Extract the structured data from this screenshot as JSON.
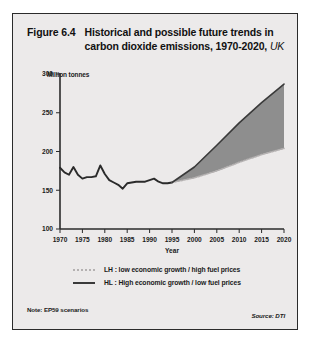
{
  "figure": {
    "number": "Figure 6.4",
    "title_line1": "Historical and possible future trends in",
    "title_line2": "carbon dioxide emissions, 1970-2020,",
    "region": "UK",
    "note": "Note: EP59 scenarios",
    "source": "Source: DTI"
  },
  "legend": {
    "items": [
      {
        "key": "LH",
        "label": "LH : low economic growth / high fuel prices",
        "style": "dotted",
        "color": "#b4b1b1"
      },
      {
        "key": "HL",
        "label": "HL : High economic growth / low fuel prices",
        "style": "solid",
        "color": "#3a3a3a"
      }
    ]
  },
  "chart_data": {
    "type": "line",
    "title": "Historical and possible future trends in carbon dioxide emissions, 1970-2020, UK",
    "xlabel": "Year",
    "ylabel": "Million tonnes",
    "xlim": [
      1970,
      2020
    ],
    "ylim": [
      100,
      300
    ],
    "xticks": [
      1970,
      1975,
      1980,
      1985,
      1990,
      1995,
      2000,
      2005,
      2010,
      2015,
      2020
    ],
    "yticks": [
      100,
      150,
      200,
      250,
      300
    ],
    "grid": false,
    "legend_position": "bottom",
    "series": [
      {
        "name": "Historical emissions",
        "style": "solid",
        "color": "#2b2b2b",
        "x": [
          1970,
          1971,
          1972,
          1973,
          1974,
          1975,
          1976,
          1977,
          1978,
          1979,
          1980,
          1981,
          1982,
          1983,
          1984,
          1985,
          1986,
          1987,
          1988,
          1989,
          1990,
          1991,
          1992,
          1993,
          1994,
          1995
        ],
        "values": [
          179,
          173,
          170,
          180,
          170,
          165,
          167,
          167,
          168,
          182,
          171,
          163,
          160,
          157,
          152,
          159,
          160,
          161,
          161,
          161,
          163,
          165,
          161,
          159,
          159,
          160
        ]
      },
      {
        "name": "LH : low economic growth / high fuel prices",
        "style": "dotted",
        "color": "#b4b1b1",
        "x": [
          1995,
          2000,
          2005,
          2010,
          2015,
          2020
        ],
        "values": [
          160,
          166,
          175,
          186,
          196,
          204
        ]
      },
      {
        "name": "HL : High economic growth / low fuel prices",
        "style": "solid",
        "color": "#3a3a3a",
        "x": [
          1995,
          2000,
          2005,
          2010,
          2015,
          2020
        ],
        "values": [
          160,
          180,
          208,
          237,
          263,
          287
        ]
      }
    ],
    "projection_band": {
      "description": "Shaded range between LH and HL scenarios",
      "fill": "#8e8e8e",
      "start_year": 1995,
      "end_year": 2020
    }
  }
}
